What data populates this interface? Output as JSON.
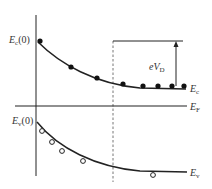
{
  "diagram": {
    "type": "band-diagram",
    "colors": {
      "line": "#222222",
      "dashed": "#777777",
      "text": "#333333",
      "background": "#ffffff"
    },
    "labels": {
      "ec0": {
        "main": "E",
        "sub": "c",
        "suffix": "(0)"
      },
      "ev0": {
        "main": "E",
        "sub": "v",
        "suffix": "(0)"
      },
      "ec": {
        "main": "E",
        "sub": "c"
      },
      "ef": {
        "main": "E",
        "sub": "F"
      },
      "ev": {
        "main": "E",
        "sub": "v"
      },
      "evd": {
        "main": "eV",
        "sub": "D"
      }
    },
    "filled_points": [
      [
        40,
        41
      ],
      [
        71,
        67
      ],
      [
        97,
        78
      ],
      [
        123,
        84
      ],
      [
        143,
        86
      ],
      [
        158,
        86
      ],
      [
        172,
        86
      ],
      [
        184,
        86
      ]
    ],
    "open_points": [
      [
        42,
        131
      ],
      [
        52,
        142
      ],
      [
        62,
        151
      ],
      [
        83,
        161
      ],
      [
        153,
        175
      ]
    ]
  }
}
